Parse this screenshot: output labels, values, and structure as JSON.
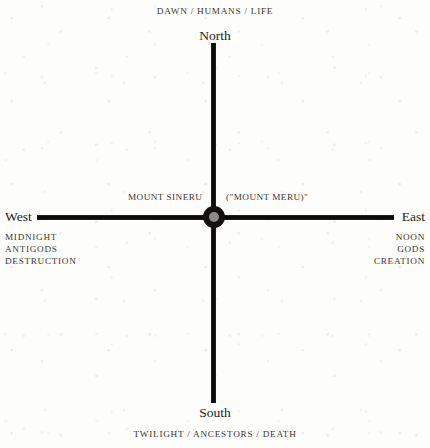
{
  "diagram": {
    "background_color": "#fdfdfb",
    "line_color": "#15120f",
    "text_color": "#3a3531",
    "center": {
      "node_color": "#141110",
      "node_core_color": "#8d8a86"
    },
    "captions": {
      "top": "DAWN / HUMANS / LIFE",
      "bottom": "TWILIGHT / ANCESTORS / DEATH"
    },
    "cardinals": {
      "north": "North",
      "south": "South",
      "west": "West",
      "east": "East"
    },
    "center_labels": {
      "left": "MOUNT SINERU",
      "right": "(\"MOUNT MERU)\""
    },
    "west_attributes": [
      "MIDNIGHT",
      "ANTIGODS",
      "DESTRUCTION"
    ],
    "east_attributes": [
      "NOON",
      "GODS",
      "CREATION"
    ]
  }
}
